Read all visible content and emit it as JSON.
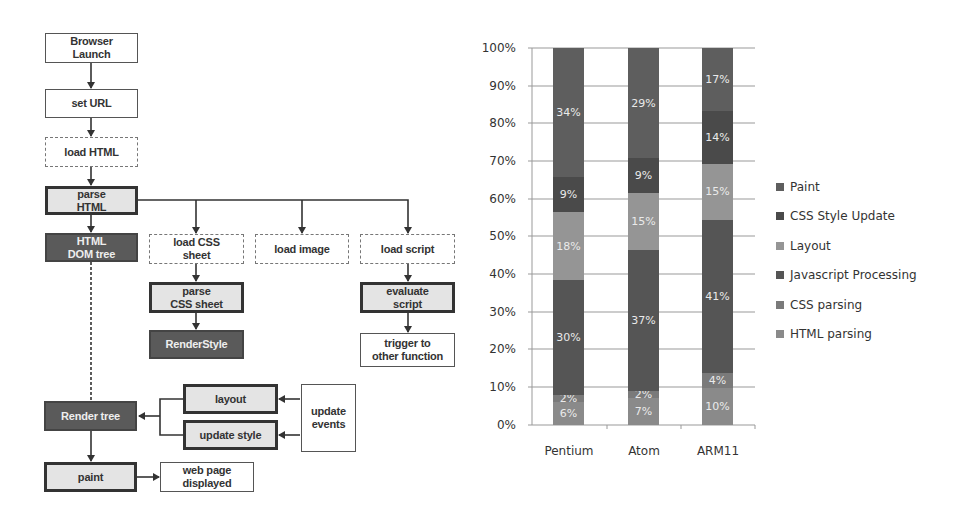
{
  "flowchart": {
    "nodes": {
      "browser_launch": "Browser\nLaunch",
      "set_url": "set URL",
      "load_html": "load HTML",
      "parse_html": "parse\nHTML",
      "html_dom_tree": "HTML\nDOM tree",
      "load_css_sheet": "load CSS\nsheet",
      "load_image": "load image",
      "load_script": "load script",
      "parse_css_sheet": "parse\nCSS sheet",
      "render_style": "RenderStyle",
      "evaluate_script": "evaluate\nscript",
      "trigger_other_function": "trigger to\nother function",
      "layout": "layout",
      "update_style": "update style",
      "update_events": "update\nevents",
      "render_tree": "Render tree",
      "paint": "paint",
      "web_page_displayed": "web page\ndisplayed"
    }
  },
  "chart_data": {
    "type": "bar",
    "stacked": true,
    "percent": true,
    "title": "",
    "xlabel": "",
    "ylabel": "",
    "ylim": [
      0,
      100
    ],
    "yticks": [
      "0%",
      "10%",
      "20%",
      "30%",
      "40%",
      "50%",
      "60%",
      "70%",
      "80%",
      "90%",
      "100%"
    ],
    "categories": [
      "Pentium",
      "Atom",
      "ARM11"
    ],
    "series": [
      {
        "name": "HTML parsing",
        "values": [
          6,
          7,
          10
        ],
        "labels": [
          "6%",
          "7%",
          "10%"
        ],
        "color": "#8a8a8a"
      },
      {
        "name": "CSS parsing",
        "values": [
          2,
          2,
          4
        ],
        "labels": [
          "2%",
          "2%",
          "4%"
        ],
        "color": "#7a7a7a"
      },
      {
        "name": "Javascript Processing",
        "values": [
          30,
          37,
          41
        ],
        "labels": [
          "30%",
          "37%",
          "41%"
        ],
        "color": "#555555"
      },
      {
        "name": "Layout",
        "values": [
          18,
          15,
          15
        ],
        "labels": [
          "18%",
          "15%",
          "15%"
        ],
        "color": "#959595"
      },
      {
        "name": "CSS Style Update",
        "values": [
          9,
          9,
          14
        ],
        "labels": [
          "9%",
          "9%",
          "14%"
        ],
        "color": "#4a4a4a"
      },
      {
        "name": "Paint",
        "values": [
          34,
          29,
          17
        ],
        "labels": [
          "34%",
          "29%",
          "17%"
        ],
        "color": "#5e5e5e"
      }
    ],
    "legend": [
      "Paint",
      "CSS Style Update",
      "Layout",
      "Javascript Processing",
      "CSS parsing",
      "HTML parsing"
    ],
    "legend_position": "right",
    "grid": true
  }
}
